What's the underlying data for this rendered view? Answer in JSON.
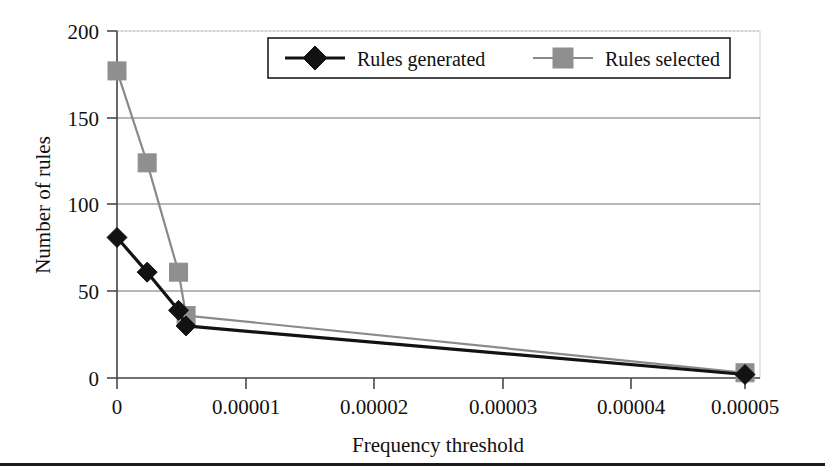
{
  "chart_data": {
    "type": "line",
    "title": "",
    "xlabel": "Frequency threshold",
    "ylabel": "Number of rules",
    "xlim": [
      0,
      5e-05
    ],
    "ylim": [
      0,
      200
    ],
    "grid": true,
    "legend_position": "top-center",
    "xticks": [
      "0",
      "0.00001",
      "0.00002",
      "0.00003",
      "0.00004",
      "0.00005"
    ],
    "xtick_values": [
      0,
      1e-05,
      2e-05,
      3e-05,
      4e-05,
      5e-05
    ],
    "yticks": [
      "0",
      "50",
      "100",
      "150",
      "200"
    ],
    "ytick_values": [
      0,
      50,
      100,
      150,
      200
    ],
    "series": [
      {
        "name": "Rules generated",
        "marker": "diamond",
        "color": "#121212",
        "x": [
          0,
          2.4e-06,
          4.9e-06,
          5.5e-06,
          5e-05
        ],
        "values": [
          81,
          61,
          39,
          30,
          2
        ]
      },
      {
        "name": "Rules selected",
        "marker": "square",
        "color": "#8f8f8f",
        "x": [
          0,
          2.4e-06,
          4.9e-06,
          5.5e-06,
          5e-05
        ],
        "values": [
          177,
          124,
          61,
          36,
          3
        ]
      }
    ]
  },
  "legend": {
    "entries": [
      {
        "label": "Rules generated"
      },
      {
        "label": "Rules selected"
      }
    ]
  },
  "axes": {
    "x_title": "Frequency threshold",
    "y_title": "Number of rules",
    "x_tick_labels": [
      "0",
      "0.00001",
      "0.00002",
      "0.00003",
      "0.00004",
      "0.00005"
    ],
    "y_tick_labels": [
      "0",
      "50",
      "100",
      "150",
      "200"
    ]
  }
}
